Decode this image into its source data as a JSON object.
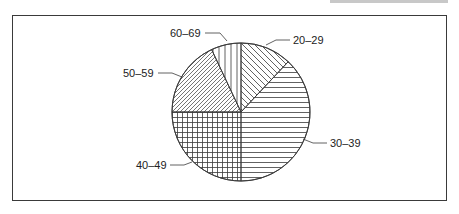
{
  "chart_data": {
    "type": "pie",
    "title": "",
    "categories": [
      "20-29",
      "30-39",
      "40-49",
      "50-59",
      "60-69"
    ],
    "values": [
      12,
      38,
      25,
      18,
      7
    ],
    "unit": "percent (estimated from slice angles)",
    "start_angle_deg": 0,
    "direction": "clockwise",
    "legend": "none (direct leader-line labels)",
    "slices": [
      {
        "label": "20-29",
        "value": 12,
        "pattern": "diagonal-back"
      },
      {
        "label": "30-39",
        "value": 38,
        "pattern": "horizontal"
      },
      {
        "label": "40-49",
        "value": 25,
        "pattern": "grid"
      },
      {
        "label": "50-59",
        "value": 18,
        "pattern": "diagonal-forward"
      },
      {
        "label": "60-69",
        "value": 7,
        "pattern": "vertical"
      }
    ]
  },
  "labels": {
    "l2029": "20–29",
    "l3039": "30–39",
    "l4049": "40–49",
    "l5059": "50–59",
    "l6069": "60–69"
  },
  "colors": {
    "stroke": "#3a3a3a",
    "background": "#ffffff",
    "text": "#222222"
  }
}
